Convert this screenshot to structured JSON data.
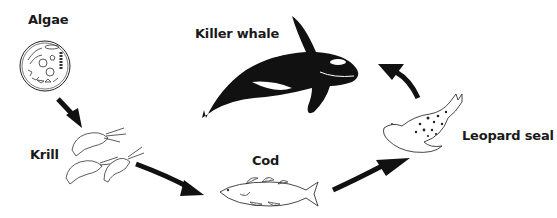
{
  "diagram": {
    "type": "food-chain-cycle",
    "organisms": [
      {
        "id": "algae",
        "label": "Algae"
      },
      {
        "id": "krill",
        "label": "Krill"
      },
      {
        "id": "cod",
        "label": "Cod"
      },
      {
        "id": "leopard_seal",
        "label": "Leopard seal"
      },
      {
        "id": "killer_whale",
        "label": "Killer whale"
      }
    ],
    "arrows": [
      {
        "from": "algae",
        "to": "krill"
      },
      {
        "from": "krill",
        "to": "cod"
      },
      {
        "from": "cod",
        "to": "leopard_seal"
      },
      {
        "from": "leopard_seal",
        "to": "killer_whale"
      }
    ],
    "colors": {
      "ink": "#111111",
      "background": "#ffffff"
    }
  }
}
